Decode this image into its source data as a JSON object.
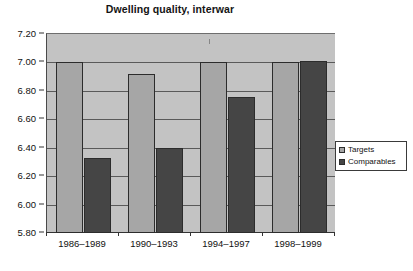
{
  "chart_data": {
    "type": "bar",
    "title": "Dwelling quality, interwar",
    "xlabel": "",
    "ylabel": "",
    "categories": [
      "1986–1989",
      "1990–1993",
      "1994–1997",
      "1998–1999"
    ],
    "series": [
      {
        "name": "Targets",
        "values": [
          7.0,
          6.92,
          7.0,
          7.0
        ],
        "color": "#a6a6a6"
      },
      {
        "name": "Comparables",
        "values": [
          6.33,
          6.4,
          6.76,
          7.01
        ],
        "color": "#454545"
      }
    ],
    "ylim": [
      5.8,
      7.2
    ],
    "ytick_step": 0.2,
    "ytick_labels": [
      "7.20",
      "7.00",
      "6.80",
      "6.60",
      "6.40",
      "6.20",
      "6.00",
      "5.80"
    ],
    "ytick_values": [
      7.2,
      7.0,
      6.8,
      6.6,
      6.4,
      6.2,
      6.0,
      5.8
    ],
    "grid": true,
    "legend_position": "right",
    "plot_background": "#c3c3c3"
  },
  "legend": {
    "items": [
      {
        "label": "Targets",
        "swatch": "targets"
      },
      {
        "label": "Comparables",
        "swatch": "comparables"
      }
    ]
  }
}
